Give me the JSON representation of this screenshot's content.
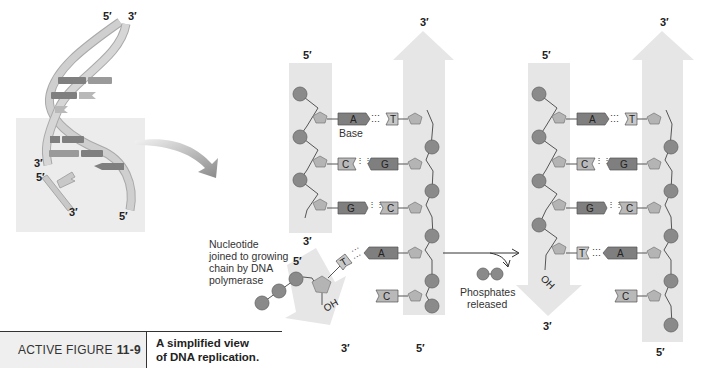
{
  "figure": {
    "label_prefix": "ACTIVE FIGURE",
    "label_number": "11-9",
    "caption_line1": "A simplified view",
    "caption_line2": "of DNA replication."
  },
  "helix": {
    "top_left": "5′",
    "top_right": "3′",
    "mid_left_3": "3′",
    "mid_left_5": "5′",
    "bottom_3": "3′",
    "bottom_5": "5′"
  },
  "panel_before": {
    "left_strand_top": "5′",
    "left_strand_bottom": "3′",
    "right_strand_top": "3′",
    "right_strand_bottom": "5′",
    "base_label": "Base",
    "pairs": [
      {
        "left": "A",
        "right": "T"
      },
      {
        "left": "C",
        "right": "G"
      },
      {
        "left": "G",
        "right": "C"
      }
    ],
    "incoming_pair": {
      "left": "T",
      "right": "A"
    },
    "unpaired": "C",
    "new_strand_5": "5′",
    "new_strand_3": "3′",
    "oh_label": "OH",
    "nucleotide_note": [
      "Nucleotide",
      "joined to growing",
      "chain by DNA",
      "polymerase"
    ]
  },
  "transition": {
    "phosphates_line1": "Phosphates",
    "phosphates_line2": "released"
  },
  "panel_after": {
    "left_strand_top": "5′",
    "left_strand_bottom": "3′",
    "right_strand_top": "3′",
    "right_strand_bottom": "5′",
    "pairs": [
      {
        "left": "A",
        "right": "T"
      },
      {
        "left": "C",
        "right": "G"
      },
      {
        "left": "G",
        "right": "C"
      },
      {
        "left": "T",
        "right": "A"
      }
    ],
    "unpaired": "C",
    "oh_label": "OH"
  },
  "colors": {
    "strand_band": "#e6e6e6",
    "phosphate": "#8a8a8a",
    "sugar": "#b4b4b4",
    "base_dark": "#7f7f7f",
    "base_light": "#b9b9b9",
    "helix_ribbon": "#c8c8c8",
    "arrow": "#8c8c8c"
  }
}
